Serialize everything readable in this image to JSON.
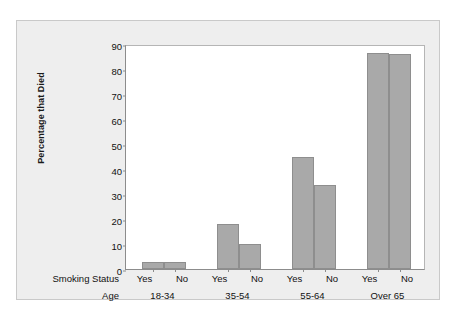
{
  "chart_data": {
    "type": "bar",
    "title": "",
    "ylabel": "Percentage that Died",
    "xlabel": "",
    "ylim": [
      0,
      90
    ],
    "yticks": [
      0,
      10,
      20,
      30,
      40,
      50,
      60,
      70,
      80,
      90
    ],
    "grid": false,
    "legend": "none",
    "bar_color": "#a9a9a9",
    "bar_border_color": "#8e8e8e",
    "panel_color": "#eeeeee",
    "plot_bg_color": "#ffffff",
    "axis_row_labels": {
      "status": "Smoking Status",
      "age": "Age"
    },
    "groups": [
      {
        "age": "18-34",
        "bars": [
          {
            "status": "Yes",
            "value": 3
          },
          {
            "status": "No",
            "value": 3
          }
        ]
      },
      {
        "age": "35-54",
        "bars": [
          {
            "status": "Yes",
            "value": 18
          },
          {
            "status": "No",
            "value": 10
          }
        ]
      },
      {
        "age": "55-64",
        "bars": [
          {
            "status": "Yes",
            "value": 45
          },
          {
            "status": "No",
            "value": 33.5
          }
        ]
      },
      {
        "age": "Over 65",
        "bars": [
          {
            "status": "Yes",
            "value": 86.5
          },
          {
            "status": "No",
            "value": 86
          }
        ]
      }
    ]
  }
}
